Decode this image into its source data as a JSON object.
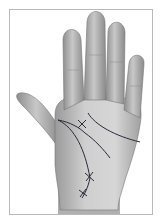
{
  "illustration": {
    "subject": "palm-of-hand",
    "style": "grayscale",
    "lines": [
      "heart-line",
      "head-line",
      "life-line",
      "fate-line"
    ],
    "marks": [
      "cross-mark-palm-center",
      "cross-mark-life-line-lower",
      "cross-mark-life-line-bottom"
    ],
    "colors": {
      "skin_light": "#d4d4d4",
      "skin_mid": "#a8a8a8",
      "skin_dark": "#7a7a7a",
      "line_ink": "#2a2a3a",
      "frame": "#b9b9b9"
    }
  }
}
